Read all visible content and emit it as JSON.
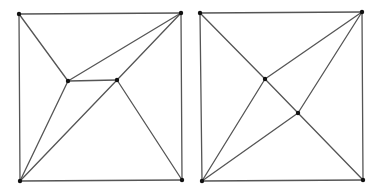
{
  "colors": {
    "edge": "#555555",
    "vertex": "#111111",
    "background": "#ffffff"
  },
  "diagrams": [
    {
      "name": "left-graph",
      "vertices": {
        "TL": [
          19,
          14
        ],
        "TR": [
          181,
          13
        ],
        "BL": [
          20,
          181
        ],
        "BR": [
          182,
          180
        ],
        "A": [
          68,
          81
        ],
        "B": [
          117,
          80
        ]
      },
      "edges": [
        [
          "TL",
          "TR"
        ],
        [
          "TR",
          "BR"
        ],
        [
          "BR",
          "BL"
        ],
        [
          "BL",
          "TL"
        ],
        [
          "TL",
          "A"
        ],
        [
          "A",
          "TR"
        ],
        [
          "A",
          "B"
        ],
        [
          "B",
          "TR"
        ],
        [
          "A",
          "BL"
        ],
        [
          "B",
          "BL"
        ],
        [
          "B",
          "BR"
        ]
      ]
    },
    {
      "name": "right-graph",
      "vertices": {
        "TL": [
          200,
          13
        ],
        "TR": [
          362,
          12
        ],
        "BL": [
          202,
          181
        ],
        "BR": [
          363,
          180
        ],
        "C": [
          265,
          79
        ],
        "D": [
          298,
          113
        ]
      },
      "edges": [
        [
          "TL",
          "TR"
        ],
        [
          "TR",
          "BR"
        ],
        [
          "BR",
          "BL"
        ],
        [
          "BL",
          "TL"
        ],
        [
          "TL",
          "C"
        ],
        [
          "C",
          "D"
        ],
        [
          "D",
          "BR"
        ],
        [
          "C",
          "TR"
        ],
        [
          "C",
          "BL"
        ],
        [
          "D",
          "TR"
        ],
        [
          "D",
          "BL"
        ]
      ]
    }
  ]
}
